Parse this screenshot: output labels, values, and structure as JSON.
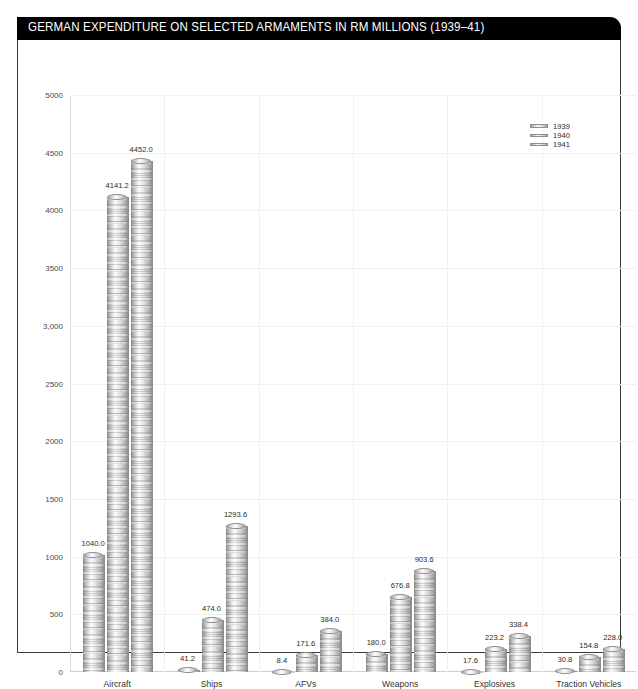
{
  "header": {
    "title": "GERMAN EXPENDITURE ON SELECTED ARMAMENTS IN RM MILLIONS (1939–41)",
    "background_color": "#000000",
    "text_color": "#ffffff"
  },
  "chart_data": {
    "type": "bar",
    "title": "GERMAN EXPENDITURE ON SELECTED ARMAMENTS IN RM MILLIONS (1939–41)",
    "xlabel": "",
    "ylabel": "",
    "ylim": [
      0,
      5000
    ],
    "ytick_step": 500,
    "ytick_labels": [
      "0",
      "500",
      "1000",
      "1500",
      "2000",
      "2500",
      "3,000",
      "3500",
      "4000",
      "4500",
      "5000"
    ],
    "ytick_values": [
      0,
      500,
      1000,
      1500,
      2000,
      2500,
      3000,
      3500,
      4000,
      4500,
      5000
    ],
    "grid": true,
    "legend_position": "top-right",
    "categories": [
      "Aircraft",
      "Ships",
      "AFVs",
      "Weapons",
      "Explosives",
      "Traction Vehicles"
    ],
    "series": [
      {
        "name": "1939",
        "values": [
          1040.0,
          41.2,
          8.4,
          180.0,
          17.6,
          30.8
        ],
        "labels": [
          "1040.0",
          "41.2",
          "8.4",
          "180.0",
          "17.6",
          "30.8"
        ]
      },
      {
        "name": "1940",
        "values": [
          4141.2,
          474.0,
          171.6,
          676.8,
          223.2,
          154.8
        ],
        "labels": [
          "4141.2",
          "474.0",
          "171.6",
          "676.8",
          "223.2",
          "154.8"
        ]
      },
      {
        "name": "1941",
        "values": [
          4452.0,
          1293.6,
          384.0,
          903.6,
          338.4,
          228.0
        ],
        "labels": [
          "4452.0",
          "1293.6",
          "384.0",
          "903.6",
          "338.4",
          "228.0"
        ]
      }
    ]
  },
  "legend": {
    "entries": [
      {
        "label": "1939"
      },
      {
        "label": "1940"
      },
      {
        "label": "1941"
      }
    ]
  }
}
